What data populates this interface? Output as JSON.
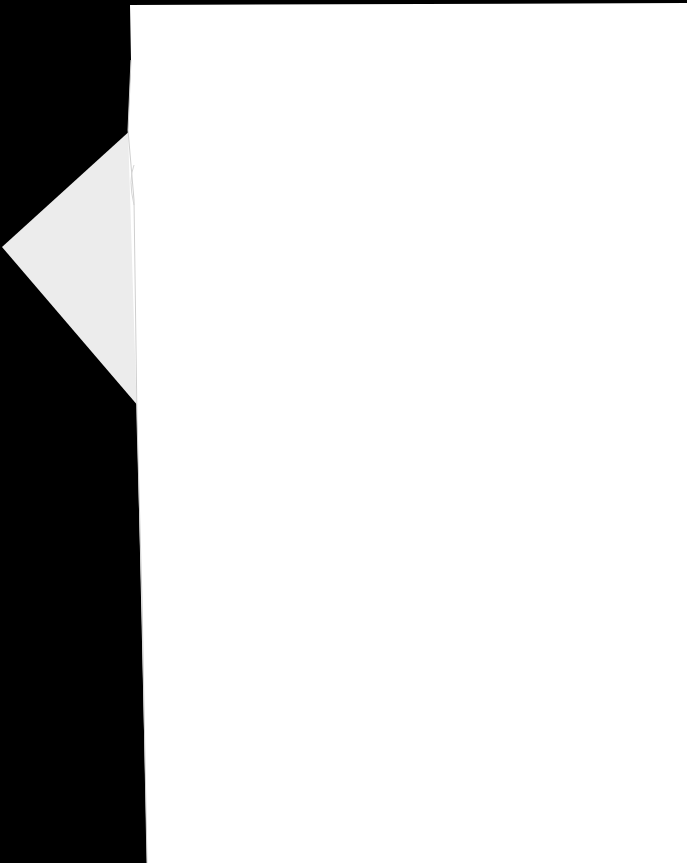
{
  "document": {
    "type": "scanned-page",
    "content_text": "",
    "colors": {
      "background": "#000000",
      "page": "#ffffff",
      "flap": "#ececec",
      "page_edge": "#d9d9d9"
    }
  }
}
